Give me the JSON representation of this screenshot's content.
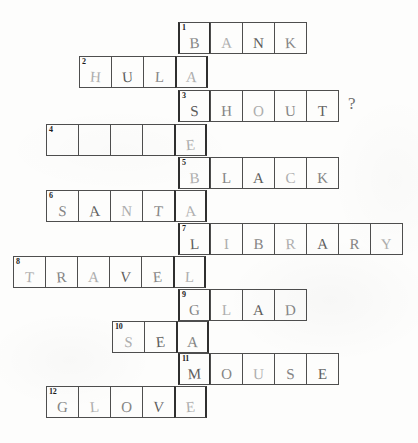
{
  "worksheet": {
    "type": "crossword-puzzle",
    "grid": {
      "cell_width": 33,
      "cell_height": 32,
      "key_column_x": 178,
      "key_column_answer": "BASEBALLGAME"
    },
    "rows": [
      {
        "number": "1",
        "answer": "BANK",
        "letters": [
          "B",
          "A",
          "N",
          "K"
        ],
        "left": 178,
        "top": 22,
        "key_index": 0,
        "trailing_mark": ""
      },
      {
        "number": "2",
        "answer": "HULA",
        "letters": [
          "H",
          "U",
          "L",
          "A"
        ],
        "left": 79,
        "top": 56,
        "key_index": 3,
        "trailing_mark": ""
      },
      {
        "number": "3",
        "answer": "SHOUT",
        "letters": [
          "S",
          "H",
          "O",
          "U",
          "T"
        ],
        "left": 178,
        "top": 90,
        "key_index": 0,
        "trailing_mark": "?"
      },
      {
        "number": "4",
        "answer": "     ",
        "letters": [
          "",
          "",
          "",
          "",
          "E"
        ],
        "left": 46,
        "top": 124,
        "key_index": 4,
        "trailing_mark": ""
      },
      {
        "number": "5",
        "answer": "BLACK",
        "letters": [
          "B",
          "L",
          "A",
          "C",
          "K"
        ],
        "left": 178,
        "top": 157,
        "key_index": 0,
        "trailing_mark": ""
      },
      {
        "number": "6",
        "answer": "SANTA",
        "letters": [
          "S",
          "A",
          "N",
          "T",
          "A"
        ],
        "left": 46,
        "top": 190,
        "key_index": 4,
        "trailing_mark": ""
      },
      {
        "number": "7",
        "answer": "LIBRARY",
        "letters": [
          "L",
          "I",
          "B",
          "R",
          "A",
          "R",
          "Y"
        ],
        "left": 178,
        "top": 223,
        "key_index": 0,
        "trailing_mark": ""
      },
      {
        "number": "8",
        "answer": "TRAVEL",
        "letters": [
          "T",
          "R",
          "A",
          "V",
          "E",
          "L"
        ],
        "left": 13,
        "top": 256,
        "key_index": 5,
        "trailing_mark": ""
      },
      {
        "number": "9",
        "answer": "GLAD",
        "letters": [
          "G",
          "L",
          "A",
          "D"
        ],
        "left": 178,
        "top": 289,
        "key_index": 0,
        "trailing_mark": ""
      },
      {
        "number": "10",
        "answer": "SEA",
        "letters": [
          "S",
          "E",
          "A"
        ],
        "left": 112,
        "top": 321,
        "key_index": 2,
        "trailing_mark": ""
      },
      {
        "number": "11",
        "answer": "MOUSE",
        "letters": [
          "M",
          "O",
          "U",
          "S",
          "E"
        ],
        "left": 178,
        "top": 353,
        "key_index": 0,
        "trailing_mark": ""
      },
      {
        "number": "12",
        "answer": "GLOVE",
        "letters": [
          "G",
          "L",
          "O",
          "V",
          "E"
        ],
        "left": 46,
        "top": 386,
        "key_index": 4,
        "trailing_mark": ""
      }
    ]
  }
}
